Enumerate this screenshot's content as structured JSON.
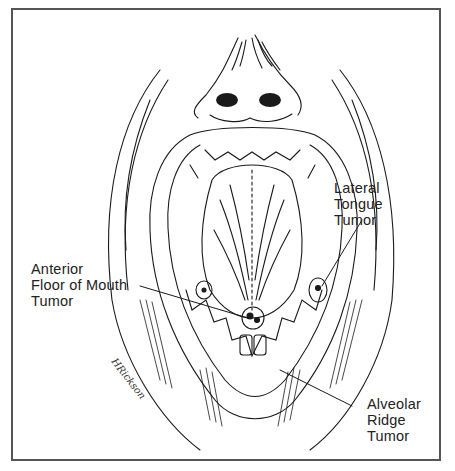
{
  "figure": {
    "labels": {
      "lateral_tongue": {
        "lines": [
          "Lateral",
          "Tongue",
          "Tumor"
        ]
      },
      "anterior_floor": {
        "lines": [
          "Anterior",
          "Floor of Mouth",
          "Tumor"
        ]
      },
      "alveolar_ridge": {
        "lines": [
          "Alveolar",
          "Ridge",
          "Tumor"
        ]
      }
    },
    "signature": "HRickson"
  },
  "colors": {
    "ink": "#1a1a1a",
    "frame": "#555555",
    "background": "#ffffff"
  }
}
